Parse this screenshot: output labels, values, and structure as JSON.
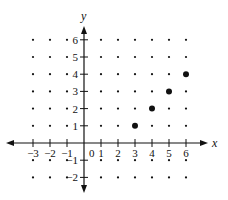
{
  "chart_data": {
    "type": "scatter",
    "title": "",
    "xlabel": "x",
    "ylabel": "y",
    "xlim": [
      -3,
      6
    ],
    "ylim": [
      -2,
      6
    ],
    "grid": "dot lattice at integer coordinates",
    "x_ticks": [
      -3,
      -2,
      -1,
      0,
      1,
      2,
      3,
      4,
      5,
      6
    ],
    "x_tick_labels": [
      "-3",
      "-2",
      "-1",
      "0",
      "1",
      "2",
      "3",
      "4",
      "5",
      "6"
    ],
    "y_ticks": [
      -2,
      -1,
      1,
      2,
      3,
      4,
      5,
      6
    ],
    "y_tick_labels": [
      "-2",
      "-1",
      "1",
      "2",
      "3",
      "4",
      "5",
      "6"
    ],
    "series": [
      {
        "name": "points",
        "x": [
          3,
          4,
          5,
          6
        ],
        "y": [
          1,
          2,
          3,
          4
        ]
      }
    ]
  },
  "colors": {
    "ink": "#111111",
    "background": "#ffffff"
  }
}
